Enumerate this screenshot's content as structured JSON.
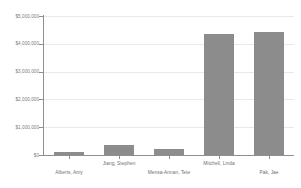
{
  "chart_data": {
    "type": "bar",
    "title": "",
    "subtitle": "",
    "xlabel": "",
    "ylabel": "",
    "categories": [
      "Alberts, Amy",
      "Jiang, Stephen",
      "Mensa-Annan, Tete",
      "Mitchell, Linda",
      "Pak, Jae"
    ],
    "values": [
      100000,
      360000,
      200000,
      4350000,
      4420000
    ],
    "ylim": [
      0,
      5000000
    ],
    "ytick_values": [
      0,
      1000000,
      2000000,
      3000000,
      4000000,
      5000000
    ],
    "ytick_labels": [
      "$0",
      "$1,000,000",
      "$2,000,000",
      "$3,000,000",
      "$4,000,000",
      "$5,000,000"
    ],
    "grid": true,
    "grid_axis": "y",
    "legend": false,
    "legend_position": "none",
    "bar_color": "#8c8c8c",
    "gridline_color": "#e9e9e9",
    "axis_color": "#8f8f8f",
    "label_color": "#6f6f6f",
    "background_color": "#ffffff",
    "xlabel_layout": "staggered-two-rows"
  }
}
